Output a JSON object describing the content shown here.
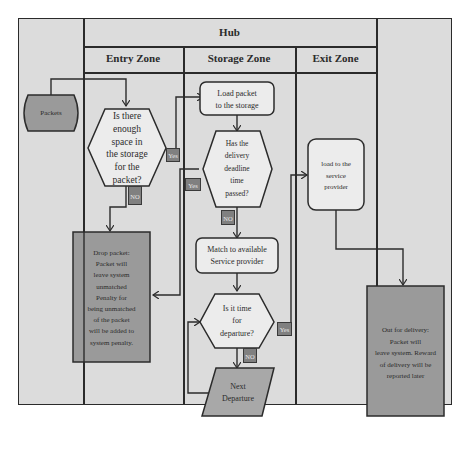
{
  "header": {
    "title": "Hub",
    "zones": [
      "Entry Zone",
      "Storage Zone",
      "Exit Zone"
    ]
  },
  "nodes": {
    "packets": "Packets",
    "space_check": [
      "Is there",
      "enough",
      "space in",
      "the storage",
      "for the",
      "packet?"
    ],
    "load_storage": [
      "Load packet",
      "to the storage"
    ],
    "deadline_check": [
      "Has the",
      "delivery",
      "deadline",
      "time",
      "passed?"
    ],
    "match_provider": [
      "Match to available",
      "Service provider"
    ],
    "departure_check": [
      "Is it time",
      "for",
      "departure?"
    ],
    "next_departure": [
      "Next",
      "Departure"
    ],
    "load_provider": [
      "load to the",
      "service",
      "provider"
    ],
    "drop_packet": [
      "Drop packet:",
      "Packet will",
      "leave system",
      "unmatched",
      "Penalty for",
      "being unmatched",
      "of the packet",
      "will be added to",
      "system penalty."
    ],
    "out_for_delivery": [
      "Out for delivery:",
      "Packet will",
      "leave system. Reward",
      "of delivery will be",
      "reported later"
    ]
  },
  "labels": {
    "yes": "Yes",
    "no": "NO"
  },
  "colors": {
    "background": "#dcdcdc",
    "line": "#2b2b2b",
    "light_node": "#ececec",
    "dark_node": "#9a9a9a",
    "tag": "#808080"
  }
}
